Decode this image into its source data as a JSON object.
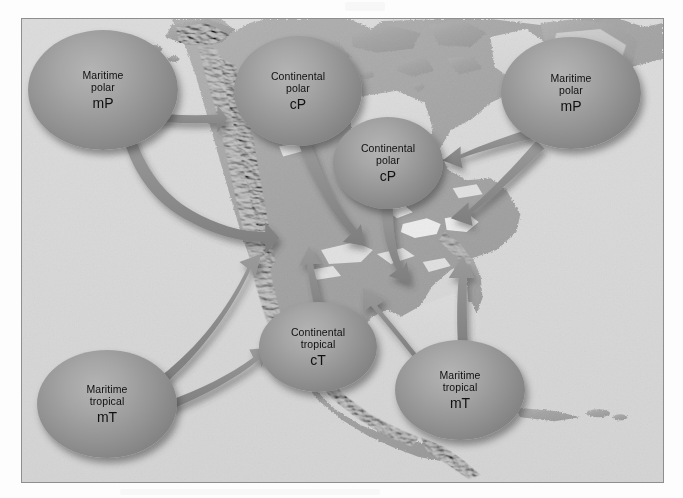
{
  "figure": {
    "kind": "air-mass-source-regions-map",
    "region": "North America",
    "frame_color": "#8e8e8e",
    "ocean_color": "#d9d9d9",
    "land_color": "#a5a5a5",
    "bubble_color": "#949494",
    "arrow_color": "#8b8b8b",
    "text_color": "#101010"
  },
  "air_masses": [
    {
      "id": "mp-pacific",
      "line1": "Maritime",
      "line2": "polar",
      "code": "mP",
      "x": 27,
      "y": 29,
      "w": 150,
      "h": 120
    },
    {
      "id": "cp-canada",
      "line1": "Continental",
      "line2": "polar",
      "code": "cP",
      "x": 233,
      "y": 35,
      "w": 128,
      "h": 110
    },
    {
      "id": "cp-hudson",
      "line1": "Continental",
      "line2": "polar",
      "code": "cP",
      "x": 332,
      "y": 116,
      "w": 110,
      "h": 92
    },
    {
      "id": "mp-atlantic",
      "line1": "Maritime",
      "line2": "polar",
      "code": "mP",
      "x": 500,
      "y": 36,
      "w": 140,
      "h": 112
    },
    {
      "id": "ct-southwest",
      "line1": "Continental",
      "line2": "tropical",
      "code": "cT",
      "x": 258,
      "y": 301,
      "w": 118,
      "h": 90
    },
    {
      "id": "mt-gulf",
      "line1": "Maritime",
      "line2": "tropical",
      "code": "mT",
      "x": 394,
      "y": 339,
      "w": 130,
      "h": 100
    },
    {
      "id": "mt-pacific",
      "line1": "Maritime",
      "line2": "tropical",
      "code": "mT",
      "x": 36,
      "y": 349,
      "w": 140,
      "h": 108
    }
  ],
  "flows": [
    {
      "id": "flow-mp-pacific-north",
      "from": "mp-pacific",
      "to": "pacific-northwest"
    },
    {
      "id": "flow-mp-pacific-south",
      "from": "mp-pacific",
      "to": "california-interior"
    },
    {
      "id": "flow-cp-canada-southeast",
      "from": "cp-canada",
      "to": "central-plains"
    },
    {
      "id": "flow-cp-hudson-south",
      "from": "cp-hudson",
      "to": "midwest"
    },
    {
      "id": "flow-mp-atlantic-west",
      "from": "mp-atlantic",
      "to": "new-england-north"
    },
    {
      "id": "flow-mp-atlantic-southwest",
      "from": "mp-atlantic",
      "to": "mid-atlantic-coast"
    },
    {
      "id": "flow-mt-pacific-northeast",
      "from": "mt-pacific",
      "to": "baja-southwest"
    },
    {
      "id": "flow-mt-pacific-east",
      "from": "mt-pacific",
      "to": "mexico-west-coast"
    },
    {
      "id": "flow-ct-southwest-north",
      "from": "ct-southwest",
      "to": "great-basin"
    },
    {
      "id": "flow-mt-gulf-north",
      "from": "mt-gulf",
      "to": "gulf-coast-interior"
    },
    {
      "id": "flow-mt-gulf-northwest",
      "from": "mt-gulf",
      "to": "texas-interior"
    }
  ]
}
